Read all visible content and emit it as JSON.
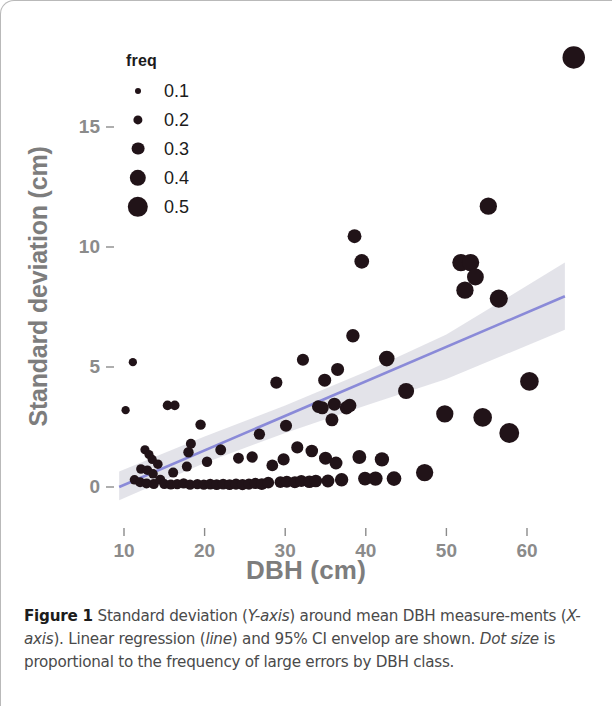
{
  "figure": {
    "caption_label": "Figure 1",
    "caption_parts": [
      {
        "text": " Standard deviation (",
        "style": "normal"
      },
      {
        "text": "Y-axis",
        "style": "italic"
      },
      {
        "text": ") around mean DBH measure-",
        "style": "normal"
      },
      {
        "text": "ments (",
        "style": "normal"
      },
      {
        "text": "X-axis",
        "style": "italic"
      },
      {
        "text": "). Linear regression (",
        "style": "normal"
      },
      {
        "text": "line",
        "style": "italic"
      },
      {
        "text": ") and 95% CI envelop are shown. ",
        "style": "normal"
      },
      {
        "text": "Dot size",
        "style": "italic"
      },
      {
        "text": " is proportional to the frequency of large errors by DBH class.",
        "style": "normal"
      }
    ],
    "caption_full": "Figure 1 Standard deviation (Y-axis) around mean DBH measurements (X-axis). Linear regression (line) and 95% CI envelop are shown. Dot size is proportional to the frequency of large errors by DBH class."
  },
  "legend": {
    "title": "freq",
    "entries": [
      {
        "label": "0.1",
        "value": 0.1,
        "radius_px": 3.0
      },
      {
        "label": "0.2",
        "value": 0.2,
        "radius_px": 4.6
      },
      {
        "label": "0.3",
        "value": 0.3,
        "radius_px": 6.4
      },
      {
        "label": "0.4",
        "value": 0.4,
        "radius_px": 8.2
      },
      {
        "label": "0.5",
        "value": 0.5,
        "radius_px": 10.2
      }
    ]
  },
  "colors": {
    "dot": "#211318",
    "regression_line": "#8a8ad8",
    "ci_band": "#d9d9e2",
    "axis_text": "#8b8b8b",
    "axis_title": "#7d7d7d",
    "frame": "#b9b9b9",
    "background": "#ffffff"
  },
  "chart_data": {
    "type": "scatter",
    "title": "",
    "xlabel": "DBH (cm)",
    "ylabel": "Standard deviation (cm)",
    "xlim": [
      7.5,
      68
    ],
    "ylim": [
      -0.9,
      18.6
    ],
    "xticks": [
      10,
      20,
      30,
      40,
      50,
      60
    ],
    "yticks": [
      0,
      5,
      10,
      15
    ],
    "xtick_labels": [
      "10",
      "20",
      "30",
      "40",
      "50",
      "60"
    ],
    "ytick_labels": [
      "0",
      "5",
      "10",
      "15"
    ],
    "grid": false,
    "legend_position": "top-left",
    "size_legend": {
      "name": "freq",
      "values": [
        0.1,
        0.2,
        0.3,
        0.4,
        0.5
      ]
    },
    "series": [
      {
        "name": "DBH standard deviation by class",
        "marker": "circle",
        "color": "#211318",
        "size_encoding": "freq",
        "points": [
          {
            "x": 11.1,
            "y": 5.2,
            "freq": 0.09
          },
          {
            "x": 10.2,
            "y": 3.2,
            "freq": 0.09
          },
          {
            "x": 12.6,
            "y": 1.55,
            "freq": 0.11
          },
          {
            "x": 13.1,
            "y": 1.35,
            "freq": 0.11
          },
          {
            "x": 13.5,
            "y": 1.15,
            "freq": 0.11
          },
          {
            "x": 12.1,
            "y": 0.75,
            "freq": 0.12
          },
          {
            "x": 12.9,
            "y": 0.7,
            "freq": 0.12
          },
          {
            "x": 13.6,
            "y": 0.55,
            "freq": 0.12
          },
          {
            "x": 11.3,
            "y": 0.3,
            "freq": 0.12
          },
          {
            "x": 12.0,
            "y": 0.2,
            "freq": 0.13
          },
          {
            "x": 12.8,
            "y": 0.15,
            "freq": 0.13
          },
          {
            "x": 13.7,
            "y": 0.12,
            "freq": 0.13
          },
          {
            "x": 14.5,
            "y": 0.3,
            "freq": 0.13
          },
          {
            "x": 14.2,
            "y": 0.95,
            "freq": 0.12
          },
          {
            "x": 15.0,
            "y": 0.12,
            "freq": 0.13
          },
          {
            "x": 15.8,
            "y": 0.1,
            "freq": 0.13
          },
          {
            "x": 16.6,
            "y": 0.12,
            "freq": 0.14
          },
          {
            "x": 16.1,
            "y": 0.6,
            "freq": 0.13
          },
          {
            "x": 15.4,
            "y": 3.4,
            "freq": 0.12
          },
          {
            "x": 16.3,
            "y": 3.4,
            "freq": 0.12
          },
          {
            "x": 17.4,
            "y": 0.15,
            "freq": 0.14
          },
          {
            "x": 18.2,
            "y": 0.1,
            "freq": 0.14
          },
          {
            "x": 17.8,
            "y": 0.85,
            "freq": 0.13
          },
          {
            "x": 18.0,
            "y": 1.45,
            "freq": 0.14
          },
          {
            "x": 18.3,
            "y": 1.8,
            "freq": 0.13
          },
          {
            "x": 19.1,
            "y": 0.12,
            "freq": 0.14
          },
          {
            "x": 19.9,
            "y": 0.1,
            "freq": 0.14
          },
          {
            "x": 19.5,
            "y": 2.6,
            "freq": 0.14
          },
          {
            "x": 20.7,
            "y": 0.12,
            "freq": 0.15
          },
          {
            "x": 21.5,
            "y": 0.1,
            "freq": 0.15
          },
          {
            "x": 20.3,
            "y": 1.05,
            "freq": 0.14
          },
          {
            "x": 22.3,
            "y": 0.12,
            "freq": 0.15
          },
          {
            "x": 23.1,
            "y": 0.1,
            "freq": 0.15
          },
          {
            "x": 22.0,
            "y": 1.55,
            "freq": 0.15
          },
          {
            "x": 23.9,
            "y": 0.12,
            "freq": 0.16
          },
          {
            "x": 24.7,
            "y": 0.1,
            "freq": 0.16
          },
          {
            "x": 24.2,
            "y": 1.2,
            "freq": 0.15
          },
          {
            "x": 25.5,
            "y": 0.12,
            "freq": 0.16
          },
          {
            "x": 26.3,
            "y": 0.15,
            "freq": 0.16
          },
          {
            "x": 25.9,
            "y": 1.25,
            "freq": 0.16
          },
          {
            "x": 27.1,
            "y": 0.12,
            "freq": 0.17
          },
          {
            "x": 27.9,
            "y": 0.18,
            "freq": 0.17
          },
          {
            "x": 26.8,
            "y": 2.2,
            "freq": 0.16
          },
          {
            "x": 28.4,
            "y": 0.9,
            "freq": 0.17
          },
          {
            "x": 28.9,
            "y": 4.35,
            "freq": 0.18
          },
          {
            "x": 29.4,
            "y": 0.2,
            "freq": 0.17
          },
          {
            "x": 30.2,
            "y": 0.22,
            "freq": 0.18
          },
          {
            "x": 29.8,
            "y": 1.15,
            "freq": 0.18
          },
          {
            "x": 30.1,
            "y": 2.55,
            "freq": 0.18
          },
          {
            "x": 31.2,
            "y": 0.2,
            "freq": 0.18
          },
          {
            "x": 32.0,
            "y": 0.25,
            "freq": 0.18
          },
          {
            "x": 31.5,
            "y": 1.65,
            "freq": 0.18
          },
          {
            "x": 32.2,
            "y": 5.3,
            "freq": 0.18
          },
          {
            "x": 33.0,
            "y": 0.22,
            "freq": 0.19
          },
          {
            "x": 33.8,
            "y": 0.25,
            "freq": 0.19
          },
          {
            "x": 33.3,
            "y": 1.5,
            "freq": 0.19
          },
          {
            "x": 34.1,
            "y": 3.35,
            "freq": 0.19
          },
          {
            "x": 34.6,
            "y": 3.3,
            "freq": 0.2
          },
          {
            "x": 34.9,
            "y": 4.45,
            "freq": 0.2
          },
          {
            "x": 35.3,
            "y": 0.25,
            "freq": 0.2
          },
          {
            "x": 35.0,
            "y": 1.2,
            "freq": 0.2
          },
          {
            "x": 35.8,
            "y": 2.8,
            "freq": 0.2
          },
          {
            "x": 36.1,
            "y": 3.45,
            "freq": 0.2
          },
          {
            "x": 36.5,
            "y": 4.9,
            "freq": 0.2
          },
          {
            "x": 36.3,
            "y": 1.0,
            "freq": 0.2
          },
          {
            "x": 37.0,
            "y": 0.3,
            "freq": 0.21
          },
          {
            "x": 37.6,
            "y": 3.3,
            "freq": 0.21
          },
          {
            "x": 38.0,
            "y": 3.4,
            "freq": 0.21
          },
          {
            "x": 38.4,
            "y": 6.3,
            "freq": 0.21
          },
          {
            "x": 38.6,
            "y": 10.45,
            "freq": 0.22
          },
          {
            "x": 39.2,
            "y": 1.25,
            "freq": 0.22
          },
          {
            "x": 39.5,
            "y": 9.4,
            "freq": 0.24
          },
          {
            "x": 39.9,
            "y": 0.35,
            "freq": 0.22
          },
          {
            "x": 41.2,
            "y": 0.35,
            "freq": 0.23
          },
          {
            "x": 42.0,
            "y": 1.15,
            "freq": 0.23
          },
          {
            "x": 42.6,
            "y": 5.35,
            "freq": 0.26
          },
          {
            "x": 43.5,
            "y": 0.35,
            "freq": 0.24
          },
          {
            "x": 45.0,
            "y": 4.0,
            "freq": 0.27
          },
          {
            "x": 47.3,
            "y": 0.6,
            "freq": 0.3
          },
          {
            "x": 49.8,
            "y": 3.05,
            "freq": 0.3
          },
          {
            "x": 51.8,
            "y": 9.35,
            "freq": 0.3
          },
          {
            "x": 52.3,
            "y": 8.2,
            "freq": 0.3
          },
          {
            "x": 53.0,
            "y": 9.35,
            "freq": 0.3
          },
          {
            "x": 53.6,
            "y": 8.75,
            "freq": 0.29
          },
          {
            "x": 54.5,
            "y": 2.9,
            "freq": 0.33
          },
          {
            "x": 55.2,
            "y": 11.7,
            "freq": 0.3
          },
          {
            "x": 56.5,
            "y": 7.85,
            "freq": 0.32
          },
          {
            "x": 57.8,
            "y": 2.25,
            "freq": 0.36
          },
          {
            "x": 60.3,
            "y": 4.4,
            "freq": 0.33
          },
          {
            "x": 65.8,
            "y": 17.9,
            "freq": 0.42
          }
        ]
      }
    ],
    "regression": {
      "name": "Linear regression",
      "color": "#8a8ad8",
      "x_start": 9.4,
      "x_end": 64.7,
      "y_start": 0.0,
      "y_end": 7.95
    },
    "ci_envelope": {
      "name": "95% CI envelop",
      "color": "#d9d9e2",
      "x": [
        9.4,
        20.0,
        30.0,
        40.0,
        50.0,
        64.7
      ],
      "lower": [
        -0.55,
        1.0,
        2.25,
        3.4,
        4.5,
        6.55
      ],
      "upper": [
        0.65,
        2.1,
        3.4,
        4.8,
        6.35,
        9.35
      ]
    }
  },
  "axes": {
    "y_title": "Standard deviation (cm)",
    "x_title": "DBH (cm)"
  }
}
